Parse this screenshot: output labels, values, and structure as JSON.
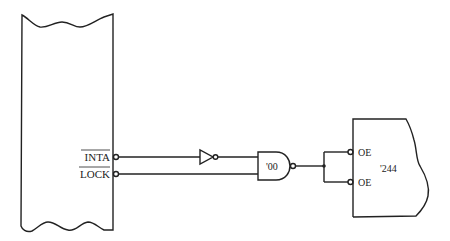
{
  "diagram": {
    "type": "logic-circuit",
    "left_block": {
      "signals": [
        {
          "name": "INTA",
          "active_low": true
        },
        {
          "name": "LOCK",
          "active_low": true
        }
      ]
    },
    "inverter": {
      "label": ""
    },
    "nand_gate": {
      "label": "'00"
    },
    "right_block": {
      "label": "'244",
      "inputs": [
        {
          "name": "OE",
          "active_low": true
        },
        {
          "name": "OE",
          "active_low": true
        }
      ]
    },
    "colors": {
      "line": "#222222",
      "background": "#ffffff"
    }
  }
}
